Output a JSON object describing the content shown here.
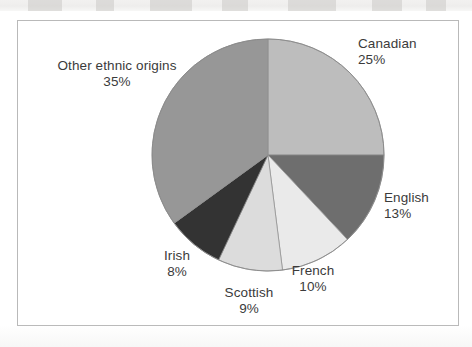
{
  "figure": {
    "background_color": "#ffffff",
    "frame_border_color": "#b9b9b9",
    "label_text_color": "#3b3b3b"
  },
  "chart_data": {
    "type": "pie",
    "title": "",
    "subtitle": "",
    "xlabel": "",
    "ylabel": "",
    "legend_position": "none",
    "grid": false,
    "start_angle_deg": 0,
    "direction": "clockwise",
    "units": "percent",
    "total": 100,
    "categories": [
      "Canadian",
      "English",
      "French",
      "Scottish",
      "Irish",
      "Other ethnic origins"
    ],
    "values": [
      25,
      13,
      10,
      9,
      8,
      35
    ],
    "value_labels": [
      "25%",
      "13%",
      "10%",
      "9%",
      "8%",
      "35%"
    ],
    "colors": [
      "#bdbdbd",
      "#6e6e6e",
      "#eaeaea",
      "#dcdcdc",
      "#333333",
      "#979797"
    ],
    "slices": [
      {
        "name": "Canadian",
        "value": 25,
        "value_label": "25%",
        "color": "#bdbdbd",
        "start_deg": 0,
        "end_deg": 90,
        "label_name": "Canadian",
        "label_value": "25%"
      },
      {
        "name": "English",
        "value": 13,
        "value_label": "13%",
        "color": "#6e6e6e",
        "start_deg": 90,
        "end_deg": 136.8,
        "label_name": "English",
        "label_value": "13%"
      },
      {
        "name": "French",
        "value": 10,
        "value_label": "10%",
        "color": "#eaeaea",
        "start_deg": 136.8,
        "end_deg": 172.8,
        "label_name": "French",
        "label_value": "10%"
      },
      {
        "name": "Scottish",
        "value": 9,
        "value_label": "9%",
        "color": "#dcdcdc",
        "start_deg": 172.8,
        "end_deg": 205.2,
        "label_name": "Scottish",
        "label_value": "9%"
      },
      {
        "name": "Irish",
        "value": 8,
        "value_label": "8%",
        "color": "#333333",
        "start_deg": 205.2,
        "end_deg": 234,
        "label_name": "Irish",
        "label_value": "8%"
      },
      {
        "name": "Other ethnic origins",
        "value": 35,
        "value_label": "35%",
        "color": "#979797",
        "start_deg": 234,
        "end_deg": 360,
        "label_name": "Other ethnic origins",
        "label_value": "35%"
      }
    ]
  }
}
